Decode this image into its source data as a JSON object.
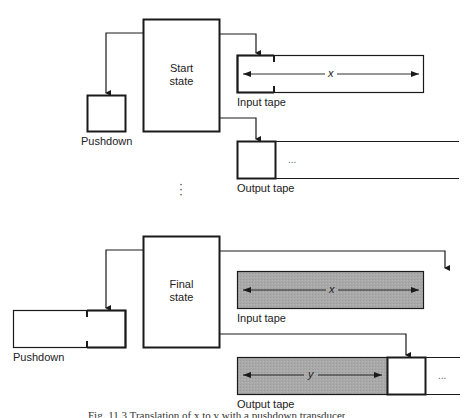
{
  "top_configuration": {
    "state_box": {
      "line1": "Start",
      "line2": "state"
    },
    "pushdown": {
      "label": "Pushdown"
    },
    "input_tape": {
      "label": "Input tape",
      "content_var": "x"
    },
    "output_tape": {
      "label": "Output tape",
      "continuation": "..."
    }
  },
  "separator": {
    "ellipsis": "⋮"
  },
  "bottom_configuration": {
    "state_box": {
      "line1": "Final",
      "line2": "state"
    },
    "pushdown": {
      "label": "Pushdown"
    },
    "input_tape": {
      "label": "Input tape",
      "content_var": "x"
    },
    "output_tape": {
      "label": "Output tape",
      "content_var": "y",
      "continuation": "..."
    }
  },
  "caption": {
    "text": "Fig. 11.3 Translation of x to y with a pushdown transducer"
  },
  "colors": {
    "line": "#1a1a1a",
    "shaded_tape": "#a9a9a9",
    "background": "#ffffff"
  }
}
